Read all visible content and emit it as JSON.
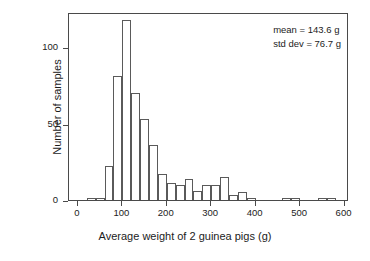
{
  "chart_data": {
    "type": "bar",
    "title": "",
    "xlabel": "Average weight of 2 guinea pigs (g)",
    "ylabel": "Number of samples",
    "xlim": [
      -20,
      610
    ],
    "ylim": [
      0,
      123
    ],
    "bin_width": 20,
    "grid": false,
    "legend": null,
    "xticks": [
      0,
      100,
      200,
      300,
      400,
      500,
      600
    ],
    "xtick_labels": [
      "0",
      "100",
      "200",
      "300",
      "400",
      "500",
      "600"
    ],
    "yticks": [
      0,
      50,
      100
    ],
    "ytick_labels": [
      "0",
      "50",
      "100"
    ],
    "bin_starts": [
      20,
      40,
      60,
      80,
      100,
      120,
      140,
      160,
      180,
      200,
      220,
      240,
      260,
      280,
      300,
      320,
      340,
      360,
      380,
      400,
      460,
      480,
      540,
      560
    ],
    "values": [
      1,
      1,
      22,
      81,
      118,
      70,
      53,
      36,
      17,
      11,
      10,
      14,
      6,
      10,
      10,
      15,
      3,
      5,
      1,
      0,
      1,
      1,
      1,
      1
    ],
    "annotations": [
      "mean = 143.6 g",
      "std dev = 76.7 g"
    ],
    "mean": "143.6",
    "std_dev": "76.7",
    "units": "g"
  },
  "annotation": {
    "mean_line": "mean = 143.6 g",
    "stddev_line": "std dev = 76.7 g"
  },
  "axes": {
    "x_title": "Average weight of 2 guinea pigs (g)",
    "y_title": "Number of samples"
  }
}
